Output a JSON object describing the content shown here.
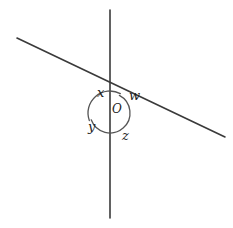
{
  "figure": {
    "background_color": "#ffffff",
    "line_color": "#3a3a3a",
    "arc_color": "#555555",
    "width": 233,
    "height": 228,
    "vertex": {
      "label": "O",
      "x": 110,
      "y": 113
    },
    "lines": [
      {
        "name": "vertical-line",
        "x1": 110,
        "y1": 10,
        "x2": 110,
        "y2": 218
      },
      {
        "name": "slanted-line",
        "x1": 17,
        "y1": 38,
        "x2": 225,
        "y2": 137
      }
    ],
    "arcs": [
      {
        "name": "upper-arc",
        "cx": 110,
        "cy": 113,
        "r": 22,
        "start_deg": 200,
        "end_deg": 62
      },
      {
        "name": "lower-arc",
        "cx": 110,
        "cy": 113,
        "r": 20,
        "start_deg": 62,
        "end_deg": 200
      }
    ],
    "angle_labels": [
      {
        "name": "angle-x",
        "text": "x",
        "x": 97,
        "y": 86
      },
      {
        "name": "angle-w",
        "text": "w",
        "x": 129,
        "y": 89
      },
      {
        "name": "angle-y",
        "text": "y",
        "x": 88,
        "y": 120
      },
      {
        "name": "angle-z",
        "text": "z",
        "x": 122,
        "y": 129
      }
    ]
  }
}
